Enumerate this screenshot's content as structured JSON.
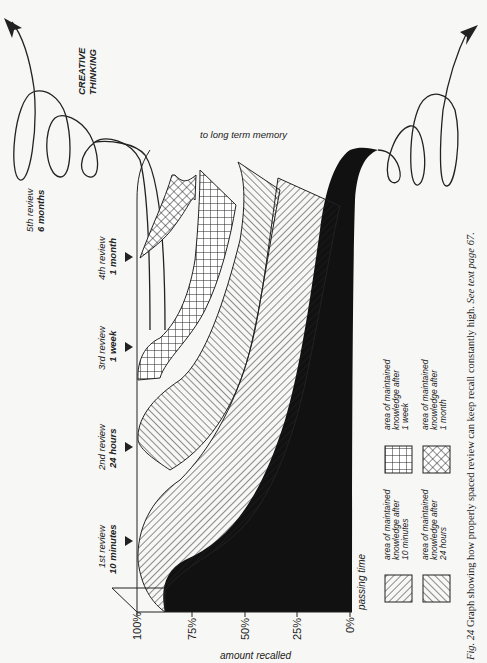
{
  "figure": {
    "caption_label": "Fig. 24",
    "caption_text": "Graph showing how properly spaced review can keep recall constantly high.",
    "caption_ref": "See text page 67."
  },
  "annotations": {
    "creative_line1": "CREATIVE",
    "creative_line2": "THINKING",
    "long_term": "to long term memory",
    "passing_time": "passing time",
    "amount_recalled": "amount recalled"
  },
  "axis": {
    "ticks": [
      "100%",
      "75%",
      "50%",
      "25%",
      "0%"
    ]
  },
  "reviews": [
    {
      "line1": "1st review",
      "line2": "10 minutes"
    },
    {
      "line1": "2nd review",
      "line2": "24 hours"
    },
    {
      "line1": "3rd review",
      "line2": "1 week"
    },
    {
      "line1": "4th review",
      "line2": "1 month"
    },
    {
      "line1": "5th review",
      "line2": "6 months"
    }
  ],
  "legend": [
    {
      "pattern": "diagonal-hatch-narrow",
      "line1": "area of maintained",
      "line2": "knowledge after",
      "line3": "10 minutes"
    },
    {
      "pattern": "diagonal-hatch-reverse",
      "line1": "area of maintained",
      "line2": "knowledge after",
      "line3": "24 hours"
    },
    {
      "pattern": "square-grid",
      "line1": "area of maintained",
      "line2": "knowledge after",
      "line3": "1 week"
    },
    {
      "pattern": "diagonal-crosshatch",
      "line1": "area of maintained",
      "line2": "knowledge after",
      "line3": "1 month"
    }
  ],
  "colors": {
    "ink": "#1a1a1a",
    "paper": "#f7f7f5",
    "fill_forgetting": "#111111"
  }
}
